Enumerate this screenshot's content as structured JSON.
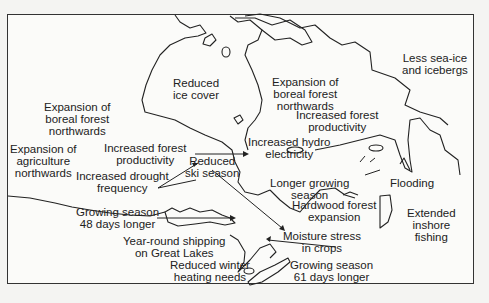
{
  "map": {
    "subject": "Projected climate change impacts in Canada",
    "labels": {
      "sea_ice": "Less sea-ice and icebergs",
      "ice_cover": "Reduced ice cover",
      "boreal_west": "Expansion of boreal forest northwards",
      "boreal_east": "Expansion of boreal forest northwards",
      "forest_prod_west": "Increased forest productivity",
      "forest_prod_east": "Increased forest productivity",
      "hydro": "Increased hydro electricity",
      "agriculture": "Expansion of agriculture northwards",
      "drought": "Increased drought frequency",
      "ski": "Reduced ski season",
      "longer_growing": "Longer growing season",
      "flooding": "Flooding",
      "hardwood": "Hardwood forest expansion",
      "fishing": "Extended inshore fishing",
      "growing_48": "Growing season 48 days longer",
      "shipping": "Year-round shipping on Great Lakes",
      "moisture": "Moisture stress in crops",
      "heating": "Reduced winter heating needs",
      "growing_61": "Growing season 61 days longer"
    },
    "lines": {
      "sea_ice": [
        "Less sea-ice",
        "and icebergs"
      ],
      "ice_cover": [
        "Reduced",
        "ice cover"
      ],
      "boreal_west": [
        "Expansion of",
        "boreal forest",
        "northwards"
      ],
      "boreal_east": [
        "Expansion of",
        "boreal forest",
        "northwards"
      ],
      "forest_prod_west": [
        "Increased forest",
        "productivity"
      ],
      "forest_prod_east": [
        "Increased forest",
        "productivity"
      ],
      "hydro": [
        "Increased hydro",
        "electricity"
      ],
      "agriculture": [
        "Expansion of",
        "agriculture",
        "northwards"
      ],
      "drought": [
        "Increased drought",
        "frequency"
      ],
      "ski": [
        "Reduced",
        "ski season"
      ],
      "longer_growing": [
        "Longer growing",
        "season"
      ],
      "flooding": [
        "Flooding"
      ],
      "hardwood": [
        "Hardwood forest",
        "expansion"
      ],
      "fishing": [
        "Extended",
        "inshore",
        "fishing"
      ],
      "growing_48": [
        "Growing season",
        "48 days longer"
      ],
      "shipping": [
        "Year-round shipping",
        "on Great Lakes"
      ],
      "moisture": [
        "Moisture stress",
        "in crops"
      ],
      "heating": [
        "Reduced winter",
        "heating needs"
      ],
      "growing_61": [
        "Growing season",
        "61 days longer"
      ]
    }
  }
}
